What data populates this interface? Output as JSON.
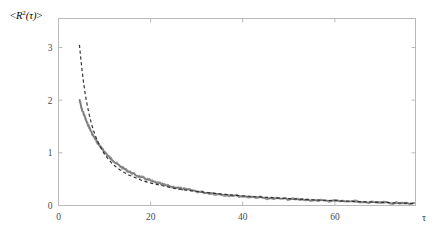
{
  "figure": {
    "background_color": "#ffffff",
    "frame_color": "#b9b9b9",
    "ylabel": "<R²(τ)>",
    "xlabel": "τ"
  },
  "chart_data": {
    "type": "line",
    "title": "",
    "xlabel": "τ",
    "ylabel": "<R²(τ)>",
    "xlim": [
      0,
      77.5
    ],
    "ylim": [
      0,
      3.55
    ],
    "xticks": [
      0,
      20,
      40,
      60
    ],
    "xtick_labels": [
      "0",
      "20",
      "40",
      "60"
    ],
    "yticks": [
      0,
      1,
      2,
      3
    ],
    "ytick_labels": [
      "0",
      "1",
      "2",
      "3"
    ],
    "grid": false,
    "legend": "none",
    "series": [
      {
        "name": "measured-data",
        "style": "solid-noisy-gray",
        "color": "#8e8e8e",
        "x": [
          4.6,
          5.0,
          5.4,
          5.8,
          6.2,
          6.6,
          7.0,
          7.5,
          8.0,
          8.5,
          9.0,
          9.5,
          10.0,
          10.6,
          11.2,
          11.8,
          12.5,
          13.2,
          14.0,
          14.8,
          15.6,
          16.5,
          17.5,
          18.5,
          19.5,
          20.6,
          21.8,
          23.0,
          24.3,
          25.7,
          27.2,
          28.8,
          30.5,
          32.3,
          34.2,
          36.2,
          38.3,
          40.5,
          42.8,
          45.2,
          47.7,
          50.3,
          53.0,
          55.8,
          58.7,
          61.7,
          64.8,
          68.0,
          71.3,
          74.7,
          77.2
        ],
        "y": [
          2.0,
          1.84,
          1.76,
          1.66,
          1.57,
          1.5,
          1.42,
          1.33,
          1.26,
          1.19,
          1.13,
          1.07,
          1.02,
          0.96,
          0.9,
          0.86,
          0.8,
          0.76,
          0.71,
          0.67,
          0.63,
          0.59,
          0.55,
          0.52,
          0.49,
          0.45,
          0.42,
          0.39,
          0.36,
          0.34,
          0.31,
          0.29,
          0.26,
          0.24,
          0.22,
          0.2,
          0.19,
          0.17,
          0.16,
          0.14,
          0.13,
          0.12,
          0.11,
          0.1,
          0.09,
          0.08,
          0.07,
          0.06,
          0.05,
          0.04,
          0.035
        ]
      },
      {
        "name": "fit-curve",
        "style": "dashed-black",
        "color": "#2e2e2e",
        "x": [
          4.55,
          4.8,
          5.1,
          5.4,
          5.8,
          6.2,
          6.6,
          7.1,
          7.6,
          8.2,
          8.8,
          9.4,
          10.1,
          10.8,
          11.6,
          12.4,
          13.3,
          14.2,
          15.2,
          16.3,
          17.4,
          18.6,
          19.9,
          21.3,
          22.8,
          24.4,
          26.1,
          27.9,
          29.8,
          31.8,
          34.0,
          36.3,
          38.8,
          41.4,
          44.2,
          47.2,
          50.3,
          53.6,
          57.1,
          60.8,
          64.7,
          68.8,
          73.1,
          77.3
        ],
        "y": [
          3.05,
          2.82,
          2.58,
          2.36,
          2.12,
          1.92,
          1.75,
          1.57,
          1.42,
          1.28,
          1.16,
          1.06,
          0.96,
          0.88,
          0.8,
          0.74,
          0.68,
          0.63,
          0.58,
          0.54,
          0.5,
          0.46,
          0.43,
          0.4,
          0.37,
          0.34,
          0.31,
          0.29,
          0.27,
          0.25,
          0.23,
          0.21,
          0.19,
          0.175,
          0.16,
          0.145,
          0.13,
          0.115,
          0.1,
          0.09,
          0.075,
          0.065,
          0.05,
          0.04
        ]
      }
    ]
  }
}
